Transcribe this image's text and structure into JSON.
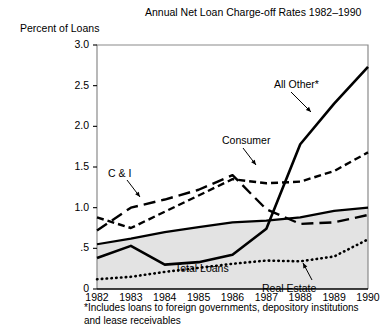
{
  "chart_data": {
    "type": "line",
    "title": "Annual Net Loan Charge-off Rates 1982–1990",
    "ylabel": "Percent of Loans",
    "xlabel": "",
    "x": [
      1982,
      1983,
      1984,
      1985,
      1986,
      1987,
      1988,
      1989,
      1990
    ],
    "xticklabels": [
      "1982",
      "1983",
      "1984",
      "1985",
      "1986",
      "1987",
      "1988",
      "1989",
      "1990"
    ],
    "yticklabels": [
      "0",
      ".5",
      "1.0",
      "1.5",
      "2.0",
      "2.5",
      "3.0"
    ],
    "ytickvalues": [
      0,
      0.5,
      1.0,
      1.5,
      2.0,
      2.5,
      3.0
    ],
    "ylim": [
      0,
      3.0
    ],
    "xlim": [
      1982,
      1990
    ],
    "grid": false,
    "legend": "inline-annotations",
    "footnote": "*Includes loans to foreign governments, depository institutions\nand lease receivables",
    "series": [
      {
        "name": "All Other*",
        "style": "solid-thick",
        "values": [
          0.38,
          0.53,
          0.3,
          0.33,
          0.42,
          0.74,
          1.78,
          2.28,
          2.73
        ]
      },
      {
        "name": "Consumer",
        "style": "short-dash",
        "values": [
          0.88,
          0.75,
          0.95,
          1.15,
          1.35,
          1.3,
          1.32,
          1.45,
          1.68
        ]
      },
      {
        "name": "C & I",
        "style": "long-dash",
        "values": [
          0.72,
          1.0,
          1.1,
          1.22,
          1.4,
          0.98,
          0.8,
          0.82,
          0.91
        ]
      },
      {
        "name": "Total Loans",
        "style": "solid-filled",
        "values": [
          0.55,
          0.62,
          0.7,
          0.76,
          0.82,
          0.84,
          0.88,
          0.96,
          1.0
        ]
      },
      {
        "name": "Real Estate",
        "style": "dotted",
        "values": [
          0.12,
          0.15,
          0.21,
          0.26,
          0.31,
          0.35,
          0.34,
          0.4,
          0.61
        ]
      }
    ]
  }
}
